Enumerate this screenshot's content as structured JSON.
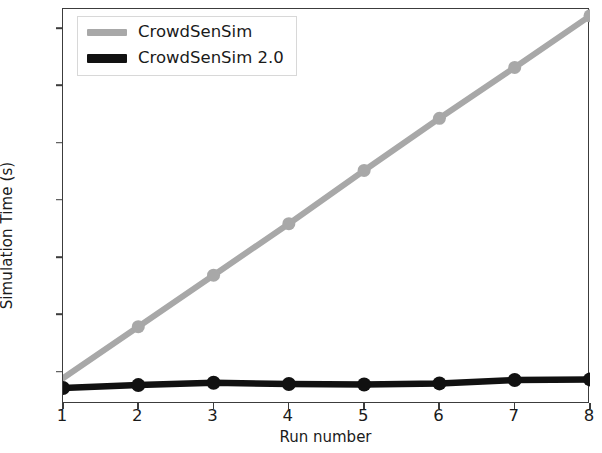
{
  "chart_data": {
    "type": "line",
    "title": "",
    "xlabel": "Run number",
    "ylabel": "Simulation Time (s)",
    "x": [
      1,
      2,
      3,
      4,
      5,
      6,
      7,
      8
    ],
    "xlim": [
      1,
      8
    ],
    "ylim": [
      4.5,
      73.5
    ],
    "xticks": [
      "1",
      "2",
      "3",
      "4",
      "5",
      "6",
      "7",
      "8"
    ],
    "yticks": [
      "10",
      "20",
      "30",
      "40",
      "50",
      "60",
      "70"
    ],
    "ytick_values": [
      10,
      20,
      30,
      40,
      50,
      60,
      70
    ],
    "grid": false,
    "legend_position": "upper left",
    "series": [
      {
        "name": "CrowdSenSim",
        "color": "#a8a8a8",
        "marker": "circle",
        "values": [
          9.0,
          18.0,
          27.0,
          36.0,
          45.3,
          54.4,
          63.3,
          72.3
        ]
      },
      {
        "name": "CrowdSenSim 2.0",
        "color": "#111111",
        "marker": "circle",
        "values": [
          7.3,
          7.8,
          8.2,
          8.0,
          7.9,
          8.1,
          8.7,
          8.8
        ]
      }
    ]
  },
  "legend": {
    "items": [
      {
        "label": "CrowdSenSim",
        "color": "#a8a8a8"
      },
      {
        "label": "CrowdSenSim 2.0",
        "color": "#111111"
      }
    ]
  },
  "axes": {
    "frame_color": "#3c3c3c"
  }
}
